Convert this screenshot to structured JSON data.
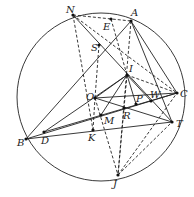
{
  "diagram": {
    "circle": {
      "cx": 101,
      "cy": 97,
      "r": 84
    },
    "points": {
      "N": {
        "x": 73,
        "y": 15,
        "label": "N",
        "lx": 66,
        "ly": 13
      },
      "A": {
        "x": 131,
        "y": 21,
        "label": "A",
        "lx": 131,
        "ly": 16
      },
      "E": {
        "x": 111,
        "y": 19,
        "label": "E",
        "lx": 103,
        "ly": 30
      },
      "S": {
        "x": 99,
        "y": 45,
        "label": "S",
        "lx": 91,
        "ly": 51
      },
      "I": {
        "x": 127,
        "y": 75,
        "label": "I",
        "lx": 129,
        "ly": 72
      },
      "O": {
        "x": 95,
        "y": 98,
        "label": "O",
        "lx": 86,
        "ly": 100
      },
      "C": {
        "x": 177,
        "y": 93,
        "label": "C",
        "lx": 180,
        "ly": 97
      },
      "W": {
        "x": 151,
        "y": 101,
        "label": "W",
        "lx": 150,
        "ly": 98
      },
      "P": {
        "x": 136,
        "y": 104,
        "label": "P",
        "lx": 136,
        "ly": 102
      },
      "R": {
        "x": 124,
        "y": 108,
        "label": "R",
        "lx": 123,
        "ly": 119
      },
      "M": {
        "x": 101,
        "y": 115,
        "label": "M",
        "lx": 104,
        "ly": 124
      },
      "K": {
        "x": 93,
        "y": 130,
        "label": "K",
        "lx": 88,
        "ly": 141
      },
      "T": {
        "x": 172,
        "y": 122,
        "label": "T",
        "lx": 176,
        "ly": 127
      },
      "B": {
        "x": 26,
        "y": 139,
        "label": "B",
        "lx": 17,
        "ly": 146
      },
      "D": {
        "x": 44,
        "y": 132,
        "label": "D",
        "lx": 41,
        "ly": 144
      },
      "J": {
        "x": 118,
        "y": 175,
        "label": "J",
        "lx": 113,
        "ly": 187
      }
    },
    "solid_segments": [
      [
        "N",
        "T"
      ],
      [
        "A",
        "B"
      ],
      [
        "A",
        "C"
      ],
      [
        "A",
        "T"
      ],
      [
        "O",
        "C"
      ],
      [
        "O",
        "T"
      ],
      [
        "O",
        "I"
      ],
      [
        "B",
        "C"
      ],
      [
        "B",
        "T"
      ],
      [
        "D",
        "I"
      ],
      [
        "D",
        "C"
      ],
      [
        "I",
        "M"
      ],
      [
        "I",
        "P"
      ],
      [
        "I",
        "W"
      ]
    ],
    "dashed_segments": [
      [
        "N",
        "A"
      ],
      [
        "N",
        "K"
      ],
      [
        "N",
        "C"
      ],
      [
        "E",
        "I"
      ],
      [
        "S",
        "O"
      ],
      [
        "A",
        "J"
      ],
      [
        "I",
        "C"
      ],
      [
        "O",
        "J"
      ],
      [
        "J",
        "C"
      ],
      [
        "J",
        "T"
      ],
      [
        "K",
        "O"
      ],
      [
        "I",
        "J"
      ]
    ]
  }
}
